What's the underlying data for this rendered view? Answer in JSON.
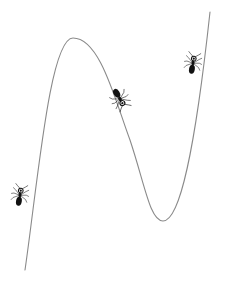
{
  "diagram": {
    "background": "#ffffff",
    "curve": {
      "type": "cubic",
      "stroke": "#8a8a8a",
      "stroke_width": 1.1,
      "points": {
        "start": [
          25,
          270
        ],
        "local_max": [
          73,
          38
        ],
        "local_min": [
          163,
          221
        ],
        "end": [
          210,
          12
        ]
      }
    },
    "ants": [
      {
        "name": "ant-left",
        "x": 20,
        "y": 195,
        "rotation": -80,
        "scale": 0.9
      },
      {
        "name": "ant-middle",
        "x": 120,
        "y": 99,
        "rotation": 60,
        "scale": 0.95
      },
      {
        "name": "ant-right",
        "x": 193,
        "y": 63,
        "rotation": -80,
        "scale": 0.9
      }
    ],
    "ant_color": "#111111"
  }
}
